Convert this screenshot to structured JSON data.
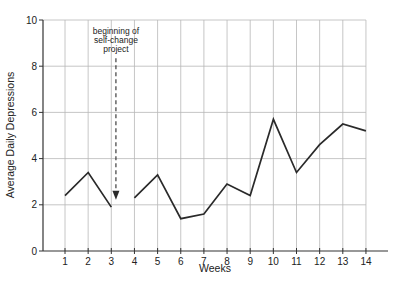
{
  "chart_data": {
    "type": "line",
    "title": "",
    "xlabel": "Weeks",
    "ylabel": "Average  Daily Depressions",
    "x": [
      1,
      2,
      3,
      4,
      5,
      6,
      7,
      8,
      9,
      10,
      11,
      12,
      13,
      14
    ],
    "x_tick_labels": [
      "1",
      "2",
      "3",
      "4",
      "5",
      "6",
      "7",
      "8",
      "9",
      "10",
      "11",
      "12",
      "13",
      "14"
    ],
    "y_tick_labels": [
      "0",
      "2",
      "4",
      "6",
      "8",
      "10"
    ],
    "y_ticks": [
      0,
      2,
      4,
      6,
      8,
      10
    ],
    "ylim": [
      0,
      10
    ],
    "xlim": [
      0,
      15
    ],
    "grid": true,
    "legend": null,
    "series": [
      {
        "name": "Average Daily Depressions",
        "segments": [
          {
            "x": [
              1,
              2,
              3
            ],
            "values": [
              2.4,
              3.4,
              1.9
            ]
          },
          {
            "x": [
              4,
              5,
              6,
              7,
              8,
              9,
              10,
              11,
              12,
              13,
              14
            ],
            "values": [
              2.3,
              3.3,
              1.4,
              1.6,
              2.9,
              2.4,
              5.7,
              3.4,
              4.6,
              5.5,
              5.2
            ]
          }
        ]
      }
    ],
    "annotations": [
      {
        "text_lines": [
          "beginning of",
          "self-change",
          "project"
        ],
        "arrow": "dashed, pointing down",
        "x": 3.2,
        "arrow_from_y": 8.0,
        "arrow_to_y": 2.0
      }
    ]
  },
  "colors": {
    "line": "#2a2a2a",
    "grid": "#b8b8b8",
    "axis": "#333333"
  }
}
